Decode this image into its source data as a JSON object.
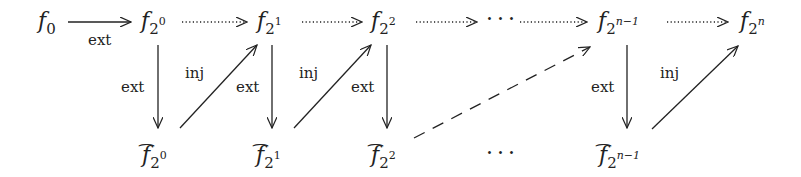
{
  "top_row": [
    {
      "base": "f",
      "sub": "0",
      "sup": ""
    },
    {
      "base": "f",
      "sub": "2",
      "sup": "0"
    },
    {
      "base": "f",
      "sub": "2",
      "sup": "1"
    },
    {
      "base": "f",
      "sub": "2",
      "sup": "2"
    },
    {
      "base": "f",
      "sub": "2",
      "sup": "n−1"
    },
    {
      "base": "f",
      "sub": "2",
      "sup": "n"
    }
  ],
  "bottom_row": [
    {
      "base": "f",
      "sub": "2",
      "sup": "0",
      "hat": "⌢"
    },
    {
      "base": "f",
      "sub": "2",
      "sup": "1",
      "hat": "⌢"
    },
    {
      "base": "f",
      "sub": "2",
      "sup": "2",
      "hat": "⌢"
    },
    {
      "base": "f",
      "sub": "2",
      "sup": "n−1",
      "hat": "⌢"
    }
  ],
  "ellipsis": "···",
  "labels": {
    "ext": "ext",
    "inj": "inj"
  },
  "edges": [
    {
      "from": "f_0",
      "to": "f_2^0",
      "label": "ext",
      "style": "solid"
    },
    {
      "from": "f_2^0",
      "to": "f_2^1",
      "style": "dotted"
    },
    {
      "from": "f_2^1",
      "to": "f_2^2",
      "style": "dotted"
    },
    {
      "from": "f_2^2",
      "to": "...",
      "style": "dotted"
    },
    {
      "from": "...",
      "to": "f_2^(n-1)",
      "style": "dotted"
    },
    {
      "from": "f_2^(n-1)",
      "to": "f_2^n",
      "style": "dotted"
    },
    {
      "from": "f_2^0",
      "to": "hat f_2^0",
      "label": "ext",
      "style": "solid"
    },
    {
      "from": "f_2^1",
      "to": "hat f_2^1",
      "label": "ext",
      "style": "solid"
    },
    {
      "from": "f_2^2",
      "to": "hat f_2^2",
      "label": "ext",
      "style": "solid"
    },
    {
      "from": "f_2^(n-1)",
      "to": "hat f_2^(n-1)",
      "label": "ext",
      "style": "solid"
    },
    {
      "from": "hat f_2^0",
      "to": "f_2^1",
      "label": "inj",
      "style": "solid"
    },
    {
      "from": "hat f_2^1",
      "to": "f_2^2",
      "label": "inj",
      "style": "solid"
    },
    {
      "from": "hat f_2^2",
      "to": "f_2^(n-1)",
      "style": "dashed"
    },
    {
      "from": "hat f_2^(n-1)",
      "to": "f_2^n",
      "label": "inj",
      "style": "solid"
    }
  ]
}
